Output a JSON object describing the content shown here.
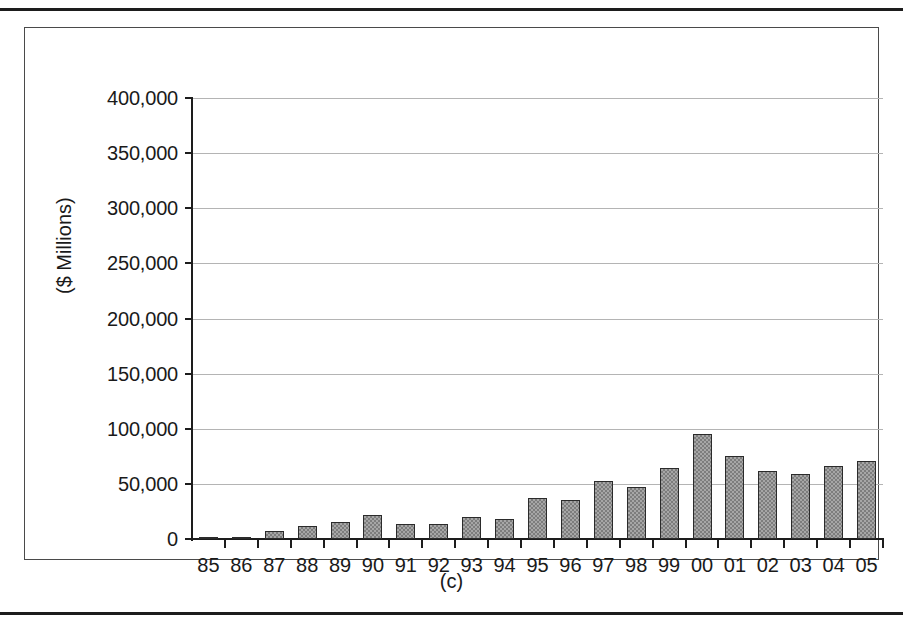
{
  "figure": {
    "caption": "(c)"
  },
  "chart_data": {
    "type": "bar",
    "title": "",
    "xlabel": "",
    "ylabel": "($ Millions)",
    "ylim": [
      0,
      400000
    ],
    "ytick_labels": [
      "400,000",
      "350,000",
      "300,000",
      "250,000",
      "200,000",
      "150,000",
      "100,000",
      "50,000",
      "0"
    ],
    "ytick_values": [
      400000,
      350000,
      300000,
      250000,
      200000,
      150000,
      100000,
      50000,
      0
    ],
    "grid": true,
    "legend": "none",
    "categories": [
      "85",
      "86",
      "87",
      "88",
      "89",
      "90",
      "91",
      "92",
      "93",
      "94",
      "95",
      "96",
      "97",
      "98",
      "99",
      "00",
      "01",
      "02",
      "03",
      "04",
      "05"
    ],
    "values": [
      400,
      1200,
      7000,
      12000,
      15000,
      22000,
      14000,
      14000,
      20000,
      18000,
      37000,
      35000,
      53000,
      47000,
      64000,
      95000,
      75000,
      62000,
      59000,
      66000,
      71000
    ],
    "bar_fill_color": "#a6a6a6",
    "bar_edge_color": "#2b2b2b",
    "gridline_color": "#b4b4b4",
    "axis_color": "#1d1d1d"
  }
}
